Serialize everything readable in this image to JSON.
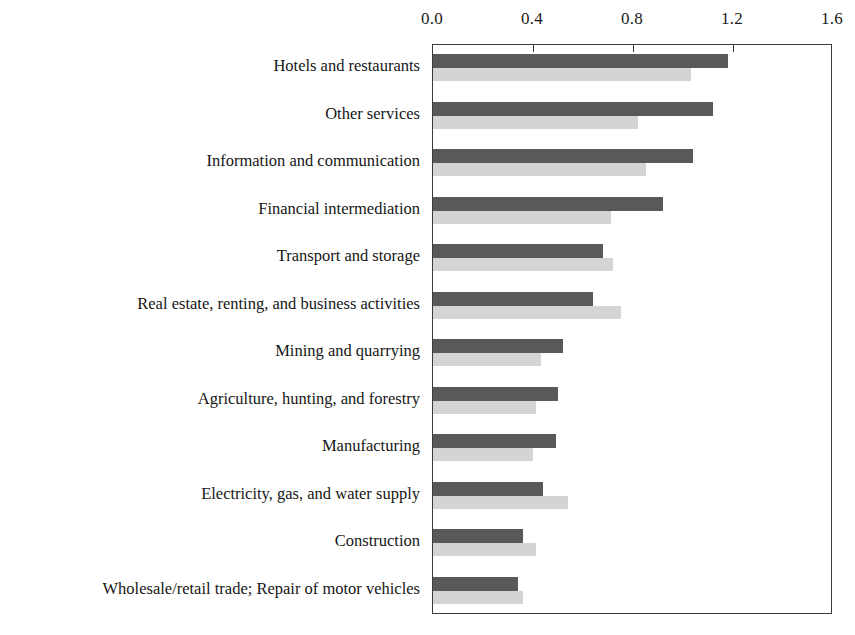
{
  "chart_data": {
    "type": "bar",
    "orientation": "horizontal",
    "title": "",
    "subtitle": "",
    "xlabel": "",
    "ylabel": "",
    "xlim": [
      0.0,
      1.6
    ],
    "xticks": [
      0.0,
      0.4,
      0.8,
      1.2,
      1.6
    ],
    "xtick_labels": [
      "0.0",
      "0.4",
      "0.8",
      "1.2",
      "1.6"
    ],
    "axis_position": "top",
    "grid": false,
    "legend": "none",
    "categories": [
      "Hotels and restaurants",
      "Other services",
      "Information and communication",
      "Financial intermediation",
      "Transport and storage",
      "Real estate, renting, and business activities",
      "Mining and quarrying",
      "Agriculture, hunting, and forestry",
      "Manufacturing",
      "Electricity, gas, and water supply",
      "Construction",
      "Wholesale/retail trade; Repair of motor vehicles"
    ],
    "series": [
      {
        "name": "series-dark",
        "color": "#595959",
        "values": [
          1.18,
          1.12,
          1.04,
          0.92,
          0.68,
          0.64,
          0.52,
          0.5,
          0.49,
          0.44,
          0.36,
          0.34
        ]
      },
      {
        "name": "series-light",
        "color": "#d4d4d4",
        "values": [
          1.03,
          0.82,
          0.85,
          0.71,
          0.72,
          0.75,
          0.43,
          0.41,
          0.4,
          0.54,
          0.41,
          0.36
        ]
      }
    ]
  },
  "colors": {
    "dark_bar": "#595959",
    "light_bar": "#d4d4d4",
    "frame": "#3b3b3b",
    "text": "#161616",
    "background": "#ffffff"
  }
}
